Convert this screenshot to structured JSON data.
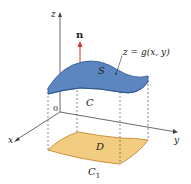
{
  "labels": {
    "z_axis": "z",
    "x_axis": "x",
    "y_axis": "y",
    "origin": "0",
    "normal": "n",
    "surface": "S",
    "surface_eq": "z = g(x, y)",
    "boundary": "C",
    "region": "D",
    "region_boundary": "C",
    "region_boundary_sub": "1"
  },
  "colors": {
    "surface_fill": "#5b86bf",
    "surface_edge": "#2f5590",
    "region_fill": "#f2cc80",
    "region_edge": "#c9913a",
    "normal_arrow": "#d9302c",
    "axis": "#444444"
  }
}
